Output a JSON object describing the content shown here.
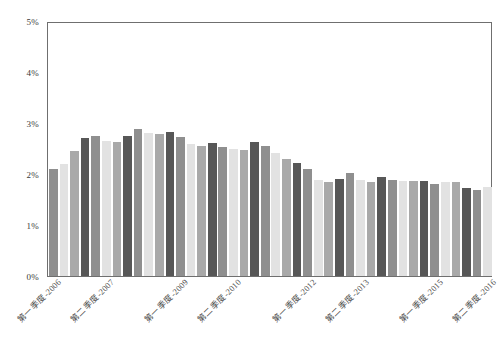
{
  "chart_data": {
    "type": "bar",
    "title": "",
    "subtitle": "",
    "xlabel": "",
    "ylabel": "",
    "ylim": [
      0,
      5
    ],
    "y_unit": "%",
    "grid": false,
    "legend": "none",
    "y_ticks": [
      "0%",
      "1%",
      "2%",
      "3%",
      "4%",
      "5%"
    ],
    "y_tick_values": [
      0,
      1,
      2,
      3,
      4,
      5
    ],
    "x_tick_labels": [
      "第一季度-2006",
      "第二季度-2007",
      "第一季度-2009",
      "第二季度-2010",
      "第一季度-2012",
      "第二季度-2013",
      "第一季度-2015",
      "第二季度-2016"
    ],
    "x_tick_indices": [
      0,
      5,
      12,
      17,
      24,
      29,
      36,
      41
    ],
    "categories": [
      "第一季度-2006",
      "第二季度-2006",
      "第三季度-2006",
      "第四季度-2006",
      "第一季度-2007",
      "第二季度-2007",
      "第三季度-2007",
      "第四季度-2007",
      "第一季度-2008",
      "第二季度-2008",
      "第三季度-2008",
      "第四季度-2008",
      "第一季度-2009",
      "第二季度-2009",
      "第三季度-2009",
      "第四季度-2009",
      "第一季度-2010",
      "第二季度-2010",
      "第三季度-2010",
      "第四季度-2010",
      "第一季度-2011",
      "第二季度-2011",
      "第三季度-2011",
      "第四季度-2011",
      "第一季度-2012",
      "第二季度-2012",
      "第三季度-2012",
      "第四季度-2012",
      "第一季度-2013",
      "第二季度-2013",
      "第三季度-2013",
      "第四季度-2013",
      "第一季度-2014",
      "第二季度-2014",
      "第三季度-2014",
      "第四季度-2014",
      "第一季度-2015",
      "第二季度-2015",
      "第三季度-2015",
      "第四季度-2015",
      "第一季度-2016",
      "第二季度-2016"
    ],
    "values": [
      2.1,
      2.2,
      2.45,
      2.7,
      2.75,
      2.65,
      2.62,
      2.75,
      2.88,
      2.8,
      2.78,
      2.82,
      2.72,
      2.58,
      2.55,
      2.6,
      2.52,
      2.5,
      2.48,
      2.62,
      2.55,
      2.42,
      2.3,
      2.22,
      2.1,
      1.88,
      1.85,
      1.9,
      2.02,
      1.88,
      1.85,
      1.95,
      1.88,
      1.87,
      1.87,
      1.87,
      1.8,
      1.85,
      1.85,
      1.72,
      1.68,
      1.75
    ],
    "bar_colors_cycle": [
      "#8f8f8f",
      "#e2e2e2",
      "#a9a9a9",
      "#575757"
    ],
    "axis_color": "#6f6f6f",
    "background_color": "#ffffff"
  }
}
